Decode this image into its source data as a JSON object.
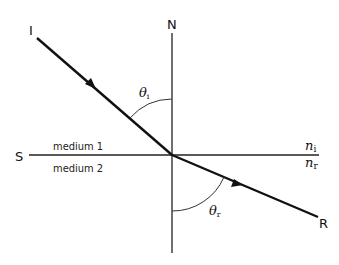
{
  "diagram": {
    "colors": {
      "line": "#111111",
      "arc": "#333333",
      "background": "#ffffff"
    },
    "labels": {
      "incident_point": "I",
      "refracted_point": "R",
      "normal": "N",
      "surface": "S",
      "medium1": "medium 1",
      "medium2": "medium 2",
      "n_i_base": "n",
      "n_i_sub": "i",
      "n_r_base": "n",
      "n_r_sub": "r",
      "theta_i_base": "θ",
      "theta_i_sub": "i",
      "theta_r_base": "θ",
      "theta_r_sub": "r"
    },
    "elements": {
      "incident_ray": {
        "from": "I",
        "to": "O",
        "arrow": "towards O"
      },
      "refracted_ray": {
        "from": "O",
        "to": "R",
        "arrow": "towards R"
      },
      "normal_line": {
        "label": "N",
        "orientation": "vertical"
      },
      "interface_line": {
        "label": "S",
        "orientation": "horizontal"
      },
      "angle_incidence": "θi (between incident ray and normal, in medium 1)",
      "angle_refraction": "θr (between refracted ray and normal, in medium 2)"
    }
  }
}
